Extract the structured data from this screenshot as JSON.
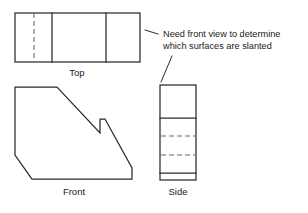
{
  "figure": {
    "type": "orthographic-projection-drawing",
    "background_color": "#ffffff",
    "line_color": "#2b2b2b",
    "hidden_line_color": "#6a6a6a",
    "views": {
      "top": {
        "label": "Top",
        "label_x": 77,
        "label_y": 76,
        "rect": {
          "x": 15,
          "y": 13,
          "width": 125,
          "height": 49
        },
        "solid_dividers": [
          52,
          106
        ],
        "hidden_dividers": [
          34
        ]
      },
      "front": {
        "label": "Front",
        "label_x": 74,
        "label_y": 195,
        "outline_points": "15,87 57,87 100,133 100,119 105,119 132,168 132,179 32,179 15,155"
      },
      "side": {
        "label": "Side",
        "label_x": 178,
        "label_y": 195,
        "rect": {
          "x": 160,
          "y": 85,
          "width": 36,
          "height": 95
        },
        "solid_dividers": [
          118,
          173
        ],
        "hidden_dividers": [
          136,
          155
        ]
      }
    },
    "annotation": {
      "line1": "Need front view to determine",
      "line2": "which surfaces are slanted",
      "line1_x": 163,
      "line1_y": 37,
      "line2_x": 163,
      "line2_y": 49,
      "leaders": [
        {
          "name": "leader-to-top-view",
          "d": "M 158,34 L 145,30"
        },
        {
          "name": "leader-to-side-view",
          "d": "M 172,56 L 161,82"
        }
      ]
    }
  }
}
